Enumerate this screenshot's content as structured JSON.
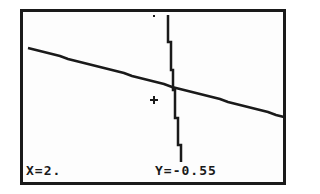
{
  "calculator_screen": {
    "mode": "graph-trace",
    "trace": {
      "x_label": "X=2.",
      "y_label": "Y=-0.55"
    },
    "graphs": [
      {
        "name": "slanted-line",
        "from": [
          28,
          48
        ],
        "to": [
          284,
          117
        ]
      },
      {
        "name": "steep-line",
        "from": [
          168,
          15
        ],
        "to": [
          182,
          162
        ]
      }
    ],
    "cursor": {
      "x": 154,
      "y": 100
    },
    "stray_pixel": {
      "x": 154,
      "y": 16
    },
    "colors": {
      "ink": "#1a1a1a",
      "screen": "#fdfdfd"
    }
  }
}
